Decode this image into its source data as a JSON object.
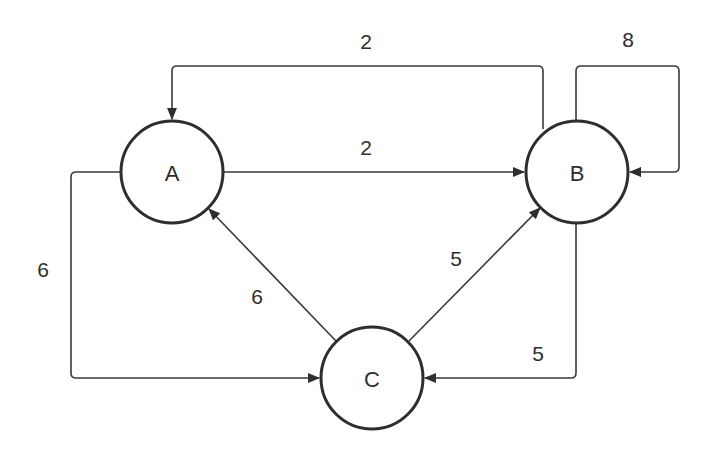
{
  "diagram": {
    "type": "weighted-directed-graph",
    "nodes": [
      {
        "id": "A",
        "label": "A"
      },
      {
        "id": "B",
        "label": "B"
      },
      {
        "id": "C",
        "label": "C"
      }
    ],
    "edges": [
      {
        "from": "B",
        "to": "A",
        "weight": "2",
        "route": "top"
      },
      {
        "from": "A",
        "to": "B",
        "weight": "2",
        "route": "straight"
      },
      {
        "from": "B",
        "to": "B",
        "weight": "8",
        "route": "self-loop"
      },
      {
        "from": "A",
        "to": "C",
        "weight": "6",
        "route": "left"
      },
      {
        "from": "C",
        "to": "A",
        "weight": "6",
        "route": "diagonal"
      },
      {
        "from": "C",
        "to": "B",
        "weight": "5",
        "route": "diagonal"
      },
      {
        "from": "B",
        "to": "C",
        "weight": "5",
        "route": "right-bottom"
      }
    ]
  },
  "colors": {
    "stroke": "#2e2e2e",
    "background": "#ffffff"
  }
}
